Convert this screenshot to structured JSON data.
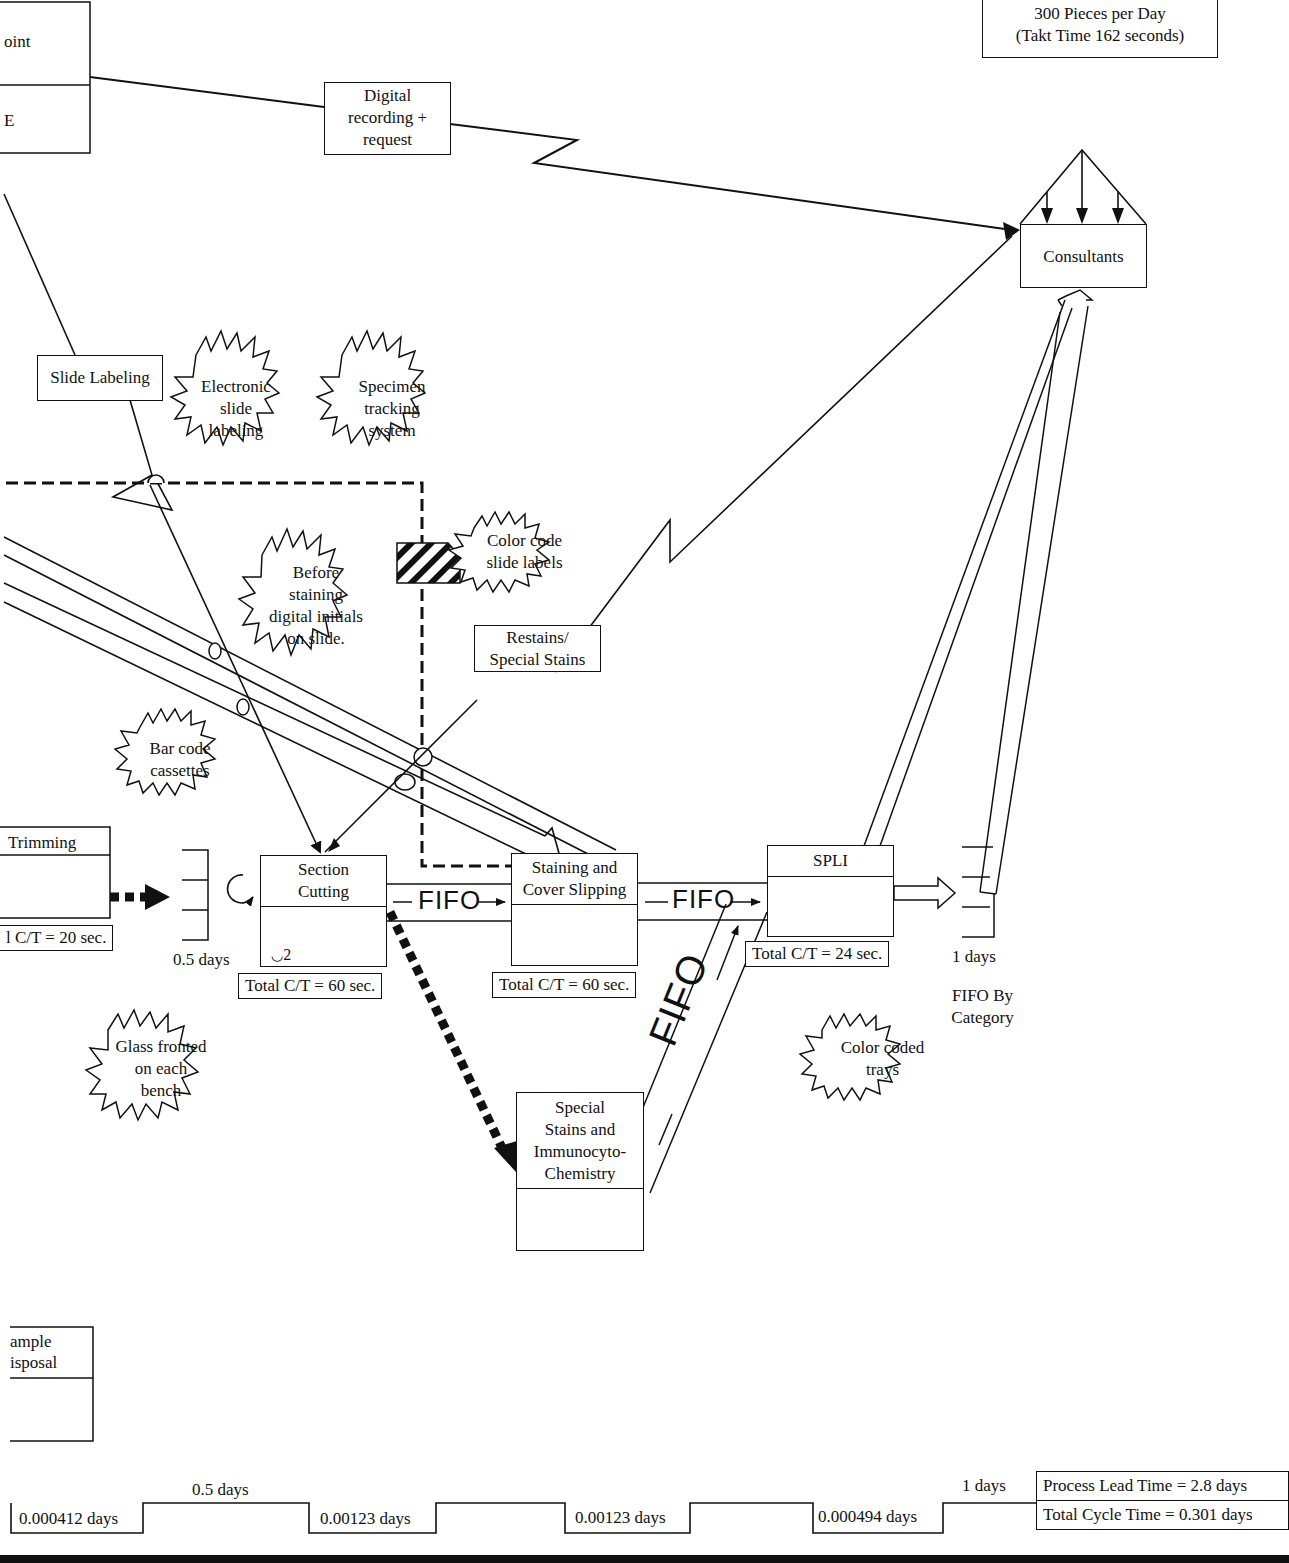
{
  "customer": {
    "demand_line": "300 Pieces per Day",
    "takt_line": "(Takt Time 162 seconds)"
  },
  "left_edge": {
    "partial_box_top_label": "oint",
    "partial_box_bottom_label": "E",
    "trimming_label": "Trimming",
    "trimming_ct": "l C/T = 20 sec.",
    "sample_disposal_line1": "ample",
    "sample_disposal_line2": "isposal"
  },
  "info_boxes": {
    "digital_recording": [
      "Digital",
      "recording +",
      "request"
    ],
    "slide_labeling": "Slide Labeling",
    "restains": [
      "Restains/",
      "Special Stains"
    ]
  },
  "consultants": {
    "label": "Consultants"
  },
  "kaizen_bursts": [
    {
      "id": "electronic-slide-labeling",
      "lines": [
        "Electronic",
        "slide",
        "labeling"
      ]
    },
    {
      "id": "specimen-tracking-system",
      "lines": [
        "Specimen",
        "tracking",
        "system"
      ]
    },
    {
      "id": "color-code-slide-labels",
      "lines": [
        "Color code",
        "slide labels"
      ]
    },
    {
      "id": "before-staining",
      "lines": [
        "Before",
        "staining",
        "digital initials",
        "on slide."
      ]
    },
    {
      "id": "bar-code-cassettes",
      "lines": [
        "Bar code",
        "cassettes"
      ]
    },
    {
      "id": "glass-fronted",
      "lines": [
        "Glass fronted",
        "on each",
        "bench"
      ]
    },
    {
      "id": "color-coded-trays",
      "lines": [
        "Color coded",
        "trays"
      ]
    }
  ],
  "processes": [
    {
      "id": "section-cutting",
      "lines": [
        "Section",
        "Cutting"
      ],
      "operators": "2",
      "ct": "Total C/T = 60 sec."
    },
    {
      "id": "staining",
      "lines": [
        "Staining and",
        "Cover Slipping"
      ],
      "ct": "Total C/T = 60 sec."
    },
    {
      "id": "spli",
      "lines": [
        "SPLI"
      ],
      "ct": "Total C/T = 24 sec."
    },
    {
      "id": "special-stains",
      "lines": [
        "Special",
        "Stains and",
        "Immunocyto-",
        "Chemistry"
      ]
    }
  ],
  "inventory": {
    "before_section_cutting": "0.5 days",
    "after_spli": "1 days",
    "after_spli_note": [
      "FIFO By",
      "Category"
    ]
  },
  "fifo_label": "FIFO",
  "timeline": {
    "lead_times": [
      "0.5 days",
      "1 days"
    ],
    "cycle_times": [
      "0.000412 days",
      "0.00123 days",
      "0.00123 days",
      "0.000494 days"
    ],
    "process_lead_time": "Process Lead Time = 2.8 days",
    "total_cycle_time": "Total Cycle Time = 0.301 days"
  }
}
